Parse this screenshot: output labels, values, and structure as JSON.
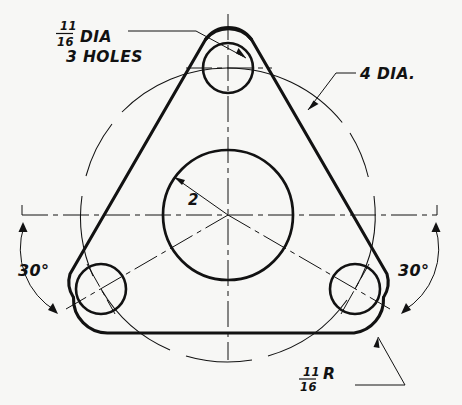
{
  "drawing": {
    "title": "Triangular flange plate — orthographic view",
    "paper_color": "#f7f7f5",
    "ink_color": "#121212",
    "annotations": {
      "hole_dia": {
        "numerator": "11",
        "denominator": "16",
        "suffix": "DIA",
        "note": "3 HOLES"
      },
      "bolt_circle": {
        "label": "4 DIA."
      },
      "bore_radius": {
        "label": "2"
      },
      "fillet_radius": {
        "numerator": "11",
        "denominator": "16",
        "suffix": "R"
      },
      "angle_left": "30°",
      "angle_right": "30°"
    },
    "geometry": {
      "center": {
        "x": 228,
        "y": 215
      },
      "bore_radius_px": 65,
      "bolt_circle_radius_px": 147,
      "hole_radius_px": 25,
      "holes": [
        {
          "name": "top-hole",
          "x": 228,
          "y": 68
        },
        {
          "name": "lower-left-hole",
          "x": 101,
          "y": 289
        },
        {
          "name": "lower-right-hole",
          "x": 355,
          "y": 289
        }
      ]
    }
  }
}
